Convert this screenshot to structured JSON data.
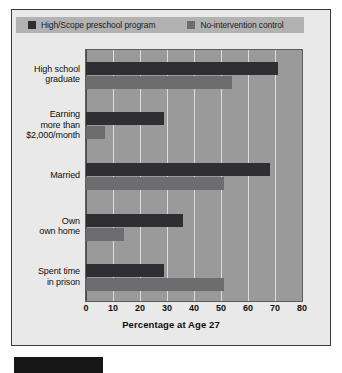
{
  "legend": {
    "entries": [
      {
        "label": "High/Scope preschool program",
        "color": "#2f2f33",
        "swatch_name": "legend-swatch-program"
      },
      {
        "label": "No-intervention control",
        "color": "#6d6d70",
        "swatch_name": "legend-swatch-control"
      }
    ]
  },
  "axis": {
    "xlabel": "Percentage at Age 27",
    "xticks": [
      "0",
      "10",
      "20",
      "30",
      "40",
      "50",
      "60",
      "70",
      "80"
    ]
  },
  "categories": [
    {
      "lines": [
        "High school",
        "graduate"
      ]
    },
    {
      "lines": [
        "Earning",
        "more than",
        "$2,000/month"
      ]
    },
    {
      "lines": [
        "Married"
      ]
    },
    {
      "lines": [
        "Own",
        "own home"
      ]
    },
    {
      "lines": [
        "Spent time",
        "in prison"
      ]
    }
  ],
  "chart_data": {
    "type": "bar",
    "orientation": "horizontal",
    "title": "",
    "xlabel": "Percentage at Age 27",
    "ylabel": "",
    "xlim": [
      0,
      80
    ],
    "xtick_step": 10,
    "grid": "vertical-white-gridlines",
    "legend_position": "top",
    "categories": [
      "High school graduate",
      "Earning more than $2,000/month",
      "Married",
      "Own own home",
      "Spent time in prison"
    ],
    "series": [
      {
        "name": "High/Scope preschool program",
        "color": "#2f2f33",
        "values": [
          71,
          29,
          68,
          36,
          29
        ]
      },
      {
        "name": "No-intervention control",
        "color": "#6d6d70",
        "values": [
          54,
          7,
          51,
          14,
          51
        ]
      }
    ]
  },
  "colors": {
    "plot_background": "#9a9a9a",
    "card_background": "#e9e9e9",
    "legend_background": "#b2b2b2",
    "gridline": "#e8e8e8"
  }
}
